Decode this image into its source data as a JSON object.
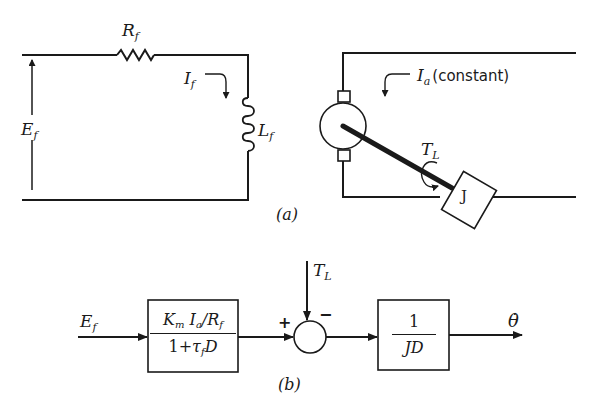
{
  "figure_a": {
    "caption": "(a)",
    "field_circuit": {
      "voltage_label": {
        "main": "E",
        "sub": "f"
      },
      "resistor_label": {
        "main": "R",
        "sub": "f"
      },
      "current_label": {
        "main": "I",
        "sub": "f"
      },
      "inductor_label": {
        "main": "L",
        "sub": "f"
      }
    },
    "armature_circuit": {
      "current_label": {
        "main": "I",
        "sub": "a",
        "note": "(constant)"
      },
      "torque_label": {
        "main": "T",
        "sub": "L"
      },
      "inertia_label": "J"
    }
  },
  "figure_b": {
    "caption": "(b)",
    "input_label": {
      "main": "E",
      "sub": "f"
    },
    "block1": {
      "numerator": {
        "k": "K",
        "k_sub": "m",
        "i": "I",
        "i_sub": "a",
        "slash": "/",
        "r": "R",
        "r_sub": "f"
      },
      "denominator": {
        "pre": "1+",
        "tau": "τ",
        "tau_sub": "f",
        "post": "D"
      }
    },
    "summing_junction": {
      "plus": "+",
      "minus": "−"
    },
    "disturbance_label": {
      "main": "T",
      "sub": "L"
    },
    "block2": {
      "numerator": "1",
      "denominator": "JD"
    },
    "output_label": "θ̇"
  },
  "colors": {
    "ink": "#1a1a1a",
    "background": "#ffffff"
  }
}
